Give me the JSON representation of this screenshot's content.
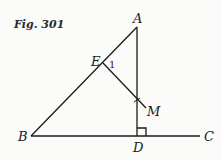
{
  "figure": {
    "caption": "Fig. 301",
    "points": {
      "A": {
        "label": "A",
        "x": 137,
        "y": 27
      },
      "B": {
        "label": "B",
        "x": 31,
        "y": 136
      },
      "C": {
        "label": "C",
        "x": 200,
        "y": 136
      },
      "D": {
        "label": "D",
        "x": 137,
        "y": 136
      },
      "E": {
        "label": "E",
        "x": 103,
        "y": 63
      },
      "M": {
        "label": "M",
        "x": 145,
        "y": 107
      }
    },
    "segments": [
      "AB",
      "AD",
      "BC",
      "EM"
    ],
    "angle_marks": [
      {
        "at": "E",
        "label": "1"
      },
      {
        "at": "D",
        "type": "right-angle"
      }
    ],
    "colors": {
      "ink": "#1a1a1a",
      "background": "#fbfbf9"
    }
  }
}
